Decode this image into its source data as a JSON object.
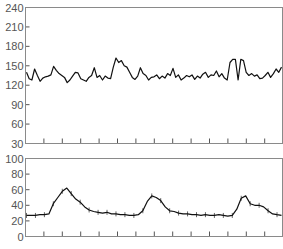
{
  "chart_data": [
    {
      "type": "line",
      "title": "",
      "xlabel": "",
      "ylabel": "",
      "ylim": [
        30,
        240
      ],
      "yticks": [
        240,
        210,
        180,
        150,
        120,
        90,
        60,
        30
      ],
      "xtick_count": 14,
      "x_tick_labels": [],
      "grid": false,
      "legend": null,
      "series": [
        {
          "name": "trace-top",
          "note": "Approximate reconstruction: confirmed peaks/baseline from zooms, gaps interpolated with jitter; not measured per-point data.",
          "x": [
            0,
            3,
            6,
            9,
            12,
            15,
            18,
            21,
            24,
            27,
            30,
            33,
            36,
            39,
            42,
            45,
            48,
            51,
            54,
            57,
            60,
            63,
            66,
            69,
            72,
            75,
            78,
            81,
            84,
            87,
            90,
            93,
            96,
            99,
            102,
            105,
            108,
            111,
            114,
            117,
            120,
            123,
            126,
            129,
            132,
            135,
            138,
            141,
            144,
            147,
            150,
            153,
            156,
            159,
            162,
            165,
            168,
            171,
            174,
            177,
            180,
            183,
            186,
            189,
            192,
            195,
            198,
            201,
            204,
            207,
            210,
            213,
            216,
            219,
            222,
            225,
            228,
            231,
            234,
            237,
            240,
            243,
            246,
            249,
            252,
            255,
            258
          ],
          "values": [
            140,
            130,
            128,
            145,
            135,
            126,
            131,
            133,
            134,
            136,
            149,
            143,
            138,
            135,
            132,
            124,
            128,
            134,
            140,
            139,
            130,
            128,
            126,
            132,
            135,
            147,
            132,
            135,
            128,
            134,
            131,
            130,
            148,
            162,
            155,
            158,
            150,
            148,
            140,
            132,
            129,
            134,
            147,
            138,
            135,
            128,
            132,
            133,
            136,
            130,
            134,
            131,
            138,
            135,
            146,
            132,
            136,
            128,
            131,
            135,
            133,
            136,
            129,
            134,
            131,
            137,
            140,
            132,
            136,
            135,
            142,
            133,
            138,
            131,
            128,
            155,
            160,
            160,
            128,
            160,
            158,
            140,
            135,
            138,
            134,
            136,
            130,
            131,
            135,
            140,
            132,
            138,
            145,
            140,
            148
          ]
        }
      ]
    },
    {
      "type": "line",
      "title": "",
      "xlabel": "",
      "ylabel": "",
      "ylim": [
        0,
        100
      ],
      "yticks": [
        100,
        80,
        60,
        40,
        20,
        0
      ],
      "xtick_count": 14,
      "x_tick_labels": [],
      "grid": false,
      "legend": null,
      "error_bars": true,
      "series": [
        {
          "name": "trace-bottom",
          "note": "Approximate reconstruction: confirmed peaks/baseline from zooms, gaps interpolated with jitter; not measured per-point data.",
          "x": [
            0,
            6,
            12,
            18,
            24,
            30,
            36,
            42,
            48,
            54,
            60,
            66,
            72,
            78,
            84,
            90,
            96,
            102,
            108,
            114,
            120,
            126,
            132,
            138,
            144,
            150,
            156,
            162,
            168,
            174,
            180,
            186,
            192,
            198,
            204,
            210,
            216,
            222,
            228,
            234,
            240,
            246,
            252,
            258
          ],
          "values": [
            27,
            27,
            27,
            28,
            28,
            29,
            42,
            50,
            58,
            62,
            55,
            48,
            44,
            38,
            34,
            32,
            31,
            30,
            31,
            29,
            29,
            28,
            28,
            27,
            27,
            28,
            33,
            45,
            52,
            50,
            46,
            38,
            33,
            32,
            30,
            29,
            29,
            28,
            28,
            27,
            28,
            27,
            27,
            28,
            27,
            26,
            27,
            35,
            49,
            52,
            42,
            40,
            40,
            38,
            33,
            29,
            28,
            27
          ]
        }
      ]
    }
  ],
  "axes": {
    "top": {
      "ytick_labels": [
        "240",
        "210",
        "180",
        "150",
        "120",
        "90",
        "60",
        "30"
      ]
    },
    "bottom": {
      "ytick_labels": [
        "100",
        "80",
        "60",
        "40",
        "20",
        "0"
      ]
    }
  },
  "colors": {
    "trace": "#111111",
    "frame": "#8a8a8a",
    "tick_label": "#555555"
  }
}
